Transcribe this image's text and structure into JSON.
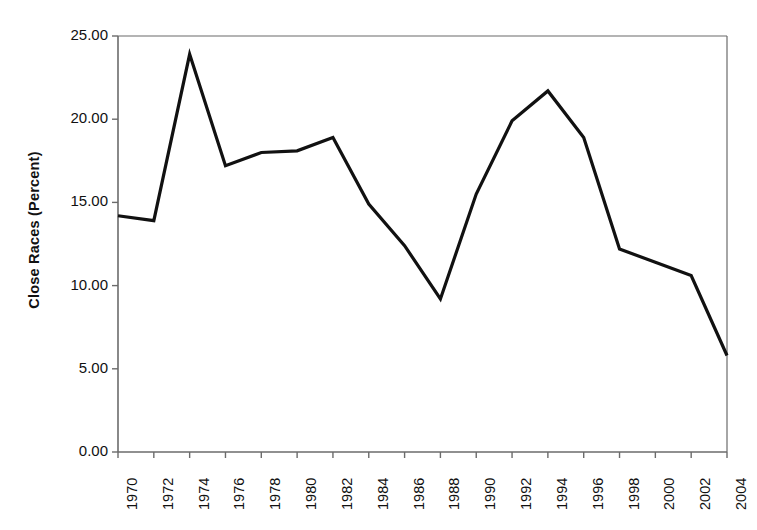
{
  "chart_data": {
    "type": "line",
    "title": "",
    "xlabel": "",
    "ylabel": "Close Races (Percent)",
    "x": [
      1970,
      1972,
      1974,
      1976,
      1978,
      1980,
      1982,
      1984,
      1986,
      1988,
      1990,
      1992,
      1994,
      1996,
      1998,
      2000,
      2002,
      2004
    ],
    "values": [
      14.2,
      13.9,
      23.9,
      17.2,
      18.0,
      18.1,
      18.9,
      14.9,
      12.4,
      9.2,
      15.5,
      19.9,
      21.7,
      18.9,
      12.2,
      11.4,
      10.6,
      5.8
    ],
    "series": [
      {
        "name": "Close Races (Percent)",
        "values": [
          14.2,
          13.9,
          23.9,
          17.2,
          18.0,
          18.1,
          18.9,
          14.9,
          12.4,
          9.2,
          15.5,
          19.9,
          21.7,
          18.9,
          12.2,
          11.4,
          10.6,
          5.8
        ]
      }
    ],
    "xlim": [
      1970,
      2004
    ],
    "ylim": [
      0,
      25
    ],
    "ytick_labels": [
      "0.00",
      "5.00",
      "10.00",
      "15.00",
      "20.00",
      "25.00"
    ],
    "ytick_values": [
      0,
      5,
      10,
      15,
      20,
      25
    ],
    "xtick_labels": [
      "1970",
      "1972",
      "1974",
      "1976",
      "1978",
      "1980",
      "1982",
      "1984",
      "1986",
      "1988",
      "1990",
      "1992",
      "1994",
      "1996",
      "1998",
      "2000",
      "2002",
      "2004"
    ],
    "grid": false,
    "legend": "none",
    "line_color": "#111111",
    "line_width": 3.2,
    "axis_color": "#6b6b6b",
    "background": "#ffffff"
  },
  "axes": {
    "y_title": "Close Races (Percent)",
    "x_title": ""
  }
}
